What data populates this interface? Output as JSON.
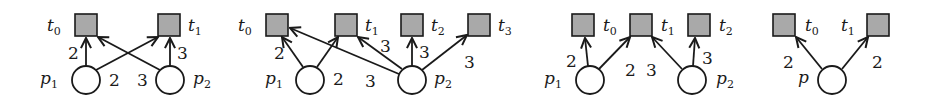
{
  "figure": {
    "colors": {
      "transition_fill": "#a9a9a9",
      "stroke": "#1a1a1a",
      "place_fill": "#ffffff"
    },
    "diagrams": [
      {
        "id": "net-1",
        "transitions": [
          {
            "id": "t0",
            "name": "t",
            "sub": "0",
            "x": 75,
            "y": 14
          },
          {
            "id": "t1",
            "name": "t",
            "sub": "1",
            "x": 158,
            "y": 14
          }
        ],
        "places": [
          {
            "id": "p1",
            "name": "p",
            "sub": "1",
            "cx": 86,
            "cy": 80
          },
          {
            "id": "p2",
            "name": "p",
            "sub": "2",
            "cx": 170,
            "cy": 80
          }
        ],
        "arcs": [
          {
            "from": "p1",
            "to": "t0",
            "weight": "2"
          },
          {
            "from": "p1",
            "to": "t1",
            "weight": "2"
          },
          {
            "from": "p2",
            "to": "t0",
            "weight": "3"
          },
          {
            "from": "p2",
            "to": "t1",
            "weight": "3"
          }
        ]
      },
      {
        "id": "net-2",
        "transitions": [
          {
            "id": "t0",
            "name": "t",
            "sub": "0",
            "x": 266,
            "y": 14
          },
          {
            "id": "t1",
            "name": "t",
            "sub": "1",
            "x": 335,
            "y": 14
          },
          {
            "id": "t2",
            "name": "t",
            "sub": "2",
            "x": 401,
            "y": 14
          },
          {
            "id": "t3",
            "name": "t",
            "sub": "3",
            "x": 468,
            "y": 14
          }
        ],
        "places": [
          {
            "id": "p1",
            "name": "p",
            "sub": "1",
            "cx": 310,
            "cy": 80
          },
          {
            "id": "p2",
            "name": "p",
            "sub": "2",
            "cx": 412,
            "cy": 80
          }
        ],
        "arcs": [
          {
            "from": "p1",
            "to": "t0",
            "weight": "2"
          },
          {
            "from": "p1",
            "to": "t1",
            "weight": "2"
          },
          {
            "from": "p2",
            "to": "t0",
            "weight": "3"
          },
          {
            "from": "p2",
            "to": "t1",
            "weight": "3"
          },
          {
            "from": "p2",
            "to": "t2",
            "weight": "3"
          },
          {
            "from": "p2",
            "to": "t3",
            "weight": "3"
          }
        ]
      },
      {
        "id": "net-3",
        "transitions": [
          {
            "id": "ta",
            "name": "",
            "sub": "",
            "x": 572,
            "y": 14
          },
          {
            "id": "t0",
            "name": "t",
            "sub": "0",
            "x": 630,
            "y": 14
          },
          {
            "id": "t1",
            "name": "t",
            "sub": "1",
            "x": 688,
            "y": 14
          }
        ],
        "transition_labels": [
          {
            "name": "t",
            "sub": "0",
            "x": 603,
            "y": 31
          },
          {
            "name": "t",
            "sub": "1",
            "x": 661,
            "y": 31
          },
          {
            "name": "t",
            "sub": "2",
            "x": 719,
            "y": 31
          }
        ],
        "places": [
          {
            "id": "p1",
            "name": "p",
            "sub": "1",
            "cx": 590,
            "cy": 80
          },
          {
            "id": "p2",
            "name": "p",
            "sub": "2",
            "cx": 692,
            "cy": 80
          }
        ],
        "arcs": [
          {
            "from": "p1",
            "to": "ta",
            "weight": "2"
          },
          {
            "from": "p1",
            "to": "t0",
            "weight": "2"
          },
          {
            "from": "p2",
            "to": "t0",
            "weight": "3"
          },
          {
            "from": "p2",
            "to": "t1",
            "weight": "3"
          }
        ]
      },
      {
        "id": "net-4",
        "transitions": [
          {
            "id": "t0",
            "name": "t",
            "sub": "0",
            "x": 773,
            "y": 14
          },
          {
            "id": "t1",
            "name": "t",
            "sub": "1",
            "x": 867,
            "y": 14
          }
        ],
        "places": [
          {
            "id": "p",
            "name": "p",
            "sub": "",
            "cx": 832,
            "cy": 80
          }
        ],
        "arcs": [
          {
            "from": "p",
            "to": "t0",
            "weight": "2"
          },
          {
            "from": "p",
            "to": "t1",
            "weight": "2"
          }
        ]
      }
    ]
  },
  "labels": {
    "n1": {
      "t0": "t",
      "t0s": "0",
      "t1": "t",
      "t1s": "1",
      "p1": "p",
      "p1s": "1",
      "p2": "p",
      "p2s": "2",
      "w_p1t0": "2",
      "w_p1t1": "2",
      "w_p2t0": "3",
      "w_p2t1": "3"
    },
    "n2": {
      "t0": "t",
      "t0s": "0",
      "t1": "t",
      "t1s": "1",
      "t2": "t",
      "t2s": "2",
      "t3": "t",
      "t3s": "3",
      "p1": "p",
      "p1s": "1",
      "p2": "p",
      "p2s": "2",
      "w_p1t0": "2",
      "w_p1t1": "2",
      "w_p2t0": "3",
      "w_p2t1": "3",
      "w_p2t2": "3",
      "w_p2t3": "3"
    },
    "n3": {
      "t0": "t",
      "t0s": "0",
      "t1": "t",
      "t1s": "1",
      "t2": "t",
      "t2s": "2",
      "p1": "p",
      "p1s": "1",
      "p2": "p",
      "p2s": "2",
      "w_a": "2",
      "w_b": "2",
      "w_c": "3",
      "w_d": "3"
    },
    "n4": {
      "t0": "t",
      "t0s": "0",
      "t1": "t",
      "t1s": "1",
      "p": "p",
      "w_l": "2",
      "w_r": "2"
    }
  }
}
